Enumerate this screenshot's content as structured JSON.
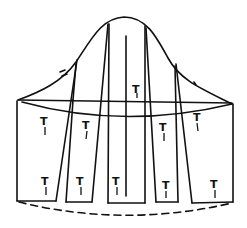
{
  "diagram": {
    "type": "sleeve-slash-and-spread-pattern",
    "stroke_color": "#111111",
    "background": "#ffffff",
    "grainline_mark": "T",
    "strips": [
      {
        "id": "strip-1",
        "top_mark": "T",
        "bottom_mark": "T"
      },
      {
        "id": "strip-2",
        "top_mark": "T",
        "bottom_mark": "T"
      },
      {
        "id": "strip-3",
        "top_mark": "T",
        "bottom_mark": "T"
      },
      {
        "id": "strip-4",
        "top_mark": "T",
        "bottom_mark": "T"
      },
      {
        "id": "strip-5",
        "top_mark": "T",
        "bottom_mark": "T"
      }
    ],
    "center_mark": "T"
  }
}
